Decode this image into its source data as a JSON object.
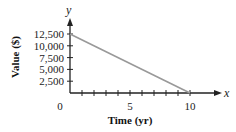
{
  "chart_data": {
    "type": "line",
    "title": "",
    "xlabel": "Time (yr)",
    "ylabel": "Value ($)",
    "x_axis_var": "x",
    "y_axis_var": "y",
    "origin_label": "0",
    "xlim": [
      0,
      11
    ],
    "ylim": [
      0,
      12500
    ],
    "x_ticks": [
      1,
      2,
      3,
      4,
      5,
      6,
      7,
      8,
      9,
      10
    ],
    "x_tick_labels": [
      {
        "value": 5,
        "label": "5"
      },
      {
        "value": 10,
        "label": "10"
      }
    ],
    "y_ticks": [
      2500,
      5000,
      7500,
      10000,
      12500
    ],
    "y_tick_labels": [
      {
        "value": 2500,
        "label": "2,500"
      },
      {
        "value": 5000,
        "label": "5,000"
      },
      {
        "value": 7500,
        "label": "7,500"
      },
      {
        "value": 10000,
        "label": "10,000"
      },
      {
        "value": 12500,
        "label": "12,500"
      }
    ],
    "grid": false,
    "legend": "none",
    "series": [
      {
        "name": "Value",
        "x": [
          0,
          10
        ],
        "y": [
          12500,
          0
        ],
        "color": "#999999"
      }
    ]
  }
}
